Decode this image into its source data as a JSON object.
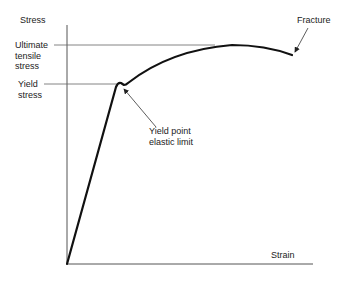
{
  "diagram": {
    "axes": {
      "y_label": "Stress",
      "x_label": "Strain"
    },
    "labels": {
      "ultimate_line1": "Ultimate",
      "ultimate_line2": "tensile",
      "ultimate_line3": "stress",
      "yield_line1": "Yield",
      "yield_line2": "stress",
      "yield_point_line1": "Yield point",
      "yield_point_line2": "elastic limit",
      "fracture": "Fracture"
    },
    "colors": {
      "curve": "#111111",
      "axis": "#555555",
      "guide": "#666666",
      "background": "#ffffff"
    }
  }
}
